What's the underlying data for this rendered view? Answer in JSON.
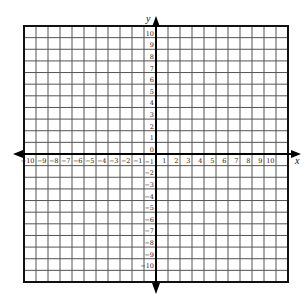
{
  "diagram": {
    "type": "coordinate-plane",
    "x_axis": {
      "label": "x",
      "min": -10,
      "max": 10,
      "tick_labels": [
        "-10",
        "-9",
        "-8",
        "-7",
        "-6",
        "-5",
        "-4",
        "-3",
        "-2",
        "-1",
        "1",
        "2",
        "3",
        "4",
        "5",
        "6",
        "7",
        "8",
        "9",
        "10"
      ]
    },
    "y_axis": {
      "label": "y",
      "min": -10,
      "max": 10,
      "tick_labels": [
        "10",
        "9",
        "8",
        "7",
        "6",
        "5",
        "4",
        "3",
        "2",
        "1",
        "0",
        "-1",
        "-2",
        "-3",
        "-4",
        "-5",
        "-6",
        "-7",
        "-8",
        "-9",
        "-10"
      ]
    },
    "grid": {
      "columns": 22,
      "rows": 22,
      "line_color": "#555555",
      "border_color": "#111111",
      "axis_color": "#000000"
    }
  }
}
